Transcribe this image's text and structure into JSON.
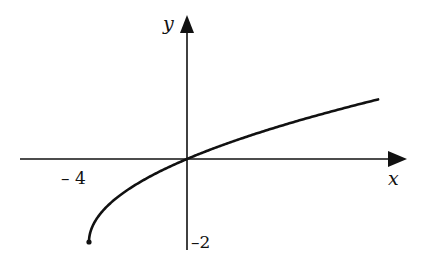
{
  "chart_data": {
    "type": "line",
    "title": "",
    "function": "y = sqrt(x + 4) - 2",
    "xlabel": "x",
    "ylabel": "y",
    "tick_labels": {
      "x": [
        "– 4"
      ],
      "y": [
        "–2"
      ]
    },
    "x": [
      -4,
      -3.5,
      -3,
      -2,
      -1,
      0,
      1,
      2,
      3,
      4,
      5,
      6,
      7,
      7.8
    ],
    "series": [
      {
        "name": "curve",
        "values": [
          -2,
          -1.29,
          -1,
          -0.59,
          -0.27,
          0,
          0.24,
          0.45,
          0.65,
          0.83,
          1,
          1.16,
          1.32,
          1.44
        ]
      }
    ],
    "endpoint": {
      "x": -4,
      "y": -2,
      "marker": "closed-dot"
    },
    "xlim": [
      -4.1,
      9
    ],
    "ylim": [
      -2.2,
      3.4
    ],
    "grid": false,
    "legend": "none"
  },
  "labels": {
    "x_axis": "x",
    "y_axis": "y",
    "x_tick": "– 4",
    "y_tick": "–2"
  }
}
